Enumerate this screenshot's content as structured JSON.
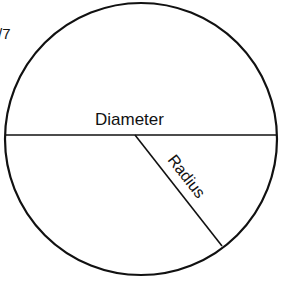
{
  "diagram": {
    "type": "circle-geometry",
    "fragment_text": "/7",
    "circle": {
      "cx": 141,
      "cy": 139,
      "r": 136,
      "stroke": "#111111"
    },
    "diameter": {
      "label": "Diameter",
      "x1": 5,
      "y1": 135,
      "x2": 277,
      "y2": 135
    },
    "radius": {
      "label": "Radius",
      "x1": 135,
      "y1": 135,
      "x2": 222,
      "y2": 246
    }
  }
}
